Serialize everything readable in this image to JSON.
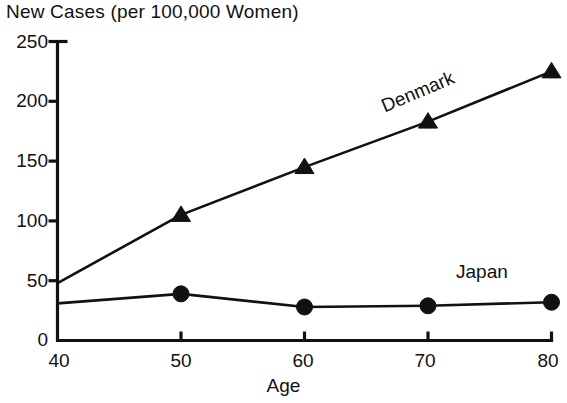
{
  "chart_data": {
    "type": "line",
    "title": "New Cases (per 100,000 Women)",
    "xlabel": "Age",
    "ylabel": "",
    "x": [
      40,
      50,
      60,
      70,
      80
    ],
    "xtick_labels": [
      "40",
      "50",
      "60",
      "70",
      "80"
    ],
    "ytick_labels": [
      "0",
      "50",
      "100",
      "150",
      "200",
      "250"
    ],
    "yticks": [
      0,
      50,
      100,
      150,
      200,
      250
    ],
    "xlim": [
      40,
      80
    ],
    "ylim": [
      0,
      250
    ],
    "grid": false,
    "legend_position": "inline-annotations",
    "series": [
      {
        "name": "Denmark",
        "marker": "triangle",
        "values": [
          48,
          105,
          145,
          183,
          225
        ]
      },
      {
        "name": "Japan",
        "marker": "circle",
        "values": [
          31,
          39,
          28,
          29,
          32
        ]
      }
    ],
    "annotations": [
      {
        "text": "Denmark",
        "x": 70,
        "y": 212,
        "rotation": -23
      },
      {
        "text": "Japan",
        "x": 72,
        "y": 66,
        "rotation": 0
      }
    ]
  },
  "colors": {
    "ink": "#111111",
    "background": "#ffffff"
  }
}
